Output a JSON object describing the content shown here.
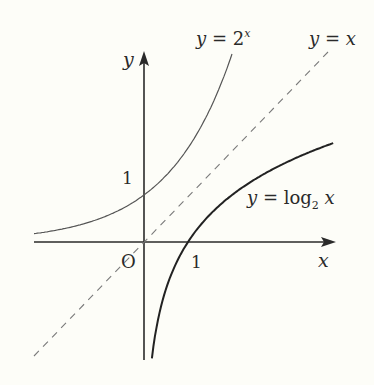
{
  "colors": {
    "background": "#fdfdf8",
    "axis": "#2a2a2a",
    "exp_curve": "#555555",
    "log_curve": "#222222",
    "identity_line": "#7a7a7a"
  },
  "axes": {
    "x_label": "x",
    "y_label": "y",
    "origin_label": "O",
    "x_tick_label": "1",
    "y_tick_label": "1"
  },
  "labels": {
    "exp": {
      "prefix": "y = 2",
      "sup": "x"
    },
    "identity": "y = x",
    "log": {
      "prefix": "y = log",
      "sub": "2",
      "suffix": " x"
    }
  },
  "chart_data": {
    "type": "line",
    "title": "",
    "xlabel": "x",
    "ylabel": "y",
    "xlim": [
      -2.5,
      4.4
    ],
    "ylim": [
      -2.5,
      4.0
    ],
    "grid": false,
    "series": [
      {
        "name": "y = 2^x",
        "function": "2^x",
        "style": "solid-thin",
        "x_range": [
          -2.5,
          2.0
        ]
      },
      {
        "name": "y = x",
        "function": "x",
        "style": "dashed",
        "x_range": [
          -2.5,
          4.0
        ]
      },
      {
        "name": "y = log2 x",
        "function": "log2(x)",
        "style": "solid-bold",
        "x_range": [
          0.18,
          4.3
        ]
      }
    ],
    "annotations": [
      {
        "text": "1",
        "at": [
          1,
          0
        ],
        "note": "x-intercept of log2 x"
      },
      {
        "text": "1",
        "at": [
          0,
          1
        ],
        "note": "y-intercept of 2^x"
      },
      {
        "text": "O",
        "at": [
          0,
          0
        ],
        "note": "origin"
      }
    ]
  }
}
